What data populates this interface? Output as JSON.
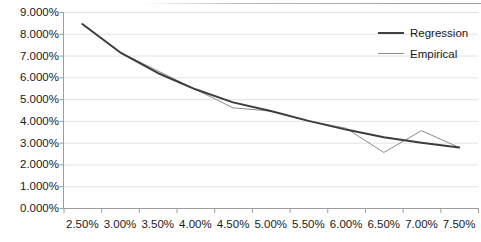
{
  "chart_data": {
    "type": "line",
    "title": "",
    "xlabel": "",
    "ylabel": "",
    "grid": true,
    "legend_position": "top-right",
    "categories": [
      "2.50%",
      "3.00%",
      "3.50%",
      "4.00%",
      "4.50%",
      "5.00%",
      "5.50%",
      "6.00%",
      "6.50%",
      "7.00%",
      "7.50%"
    ],
    "x": [
      2.5,
      3.0,
      3.5,
      4.0,
      4.5,
      5.0,
      5.5,
      6.0,
      6.5,
      7.0,
      7.5
    ],
    "xlim": [
      2.25,
      7.75
    ],
    "ylim": [
      0,
      9
    ],
    "y_ticks": [
      0,
      1,
      2,
      3,
      4,
      5,
      6,
      7,
      8,
      9
    ],
    "y_tick_labels": [
      "0.000%",
      "1.000%",
      "2.000%",
      "3.000%",
      "4.000%",
      "5.000%",
      "6.000%",
      "7.000%",
      "8.000%",
      "9.000%"
    ],
    "series": [
      {
        "name": "Regression",
        "color": "#3d3d3d",
        "width": 2.0,
        "values": [
          8.45,
          7.15,
          6.2,
          5.45,
          4.85,
          4.45,
          4.0,
          3.6,
          3.25,
          3.0,
          2.78
        ]
      },
      {
        "name": "Empirical",
        "color": "#8c8c8c",
        "width": 1.0,
        "values": [
          8.45,
          7.15,
          6.3,
          5.45,
          4.6,
          4.45,
          4.0,
          3.66,
          2.55,
          3.55,
          2.78
        ]
      }
    ]
  },
  "axis": {
    "y_labels": [
      "9.000%",
      "8.000%",
      "7.000%",
      "6.000%",
      "5.000%",
      "4.000%",
      "3.000%",
      "2.000%",
      "1.000%",
      "0.000%"
    ],
    "x_labels": [
      "2.50%",
      "3.00%",
      "3.50%",
      "4.00%",
      "4.50%",
      "5.00%",
      "5.50%",
      "6.00%",
      "6.50%",
      "7.00%",
      "7.50%"
    ]
  },
  "legend": {
    "items": [
      {
        "label": "Regression"
      },
      {
        "label": "Empirical"
      }
    ]
  },
  "colors": {
    "regression": "#3d3d3d",
    "empirical": "#8c8c8c",
    "grid": "#e3e3e3",
    "axis": "#9d9d9d",
    "text": "#1a1a1a",
    "background": "#ffffff"
  }
}
